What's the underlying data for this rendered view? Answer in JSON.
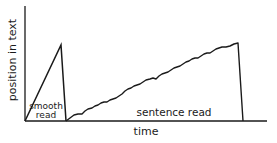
{
  "diagram": {
    "type": "line-sketch",
    "xlabel": "time",
    "ylabel": "position in text",
    "regions": [
      {
        "label_line1": "smooth",
        "label_line2": "read"
      },
      {
        "label": "sentence read"
      }
    ],
    "colors": {
      "ink": "#1a1a1a",
      "background": "#ffffff"
    }
  }
}
